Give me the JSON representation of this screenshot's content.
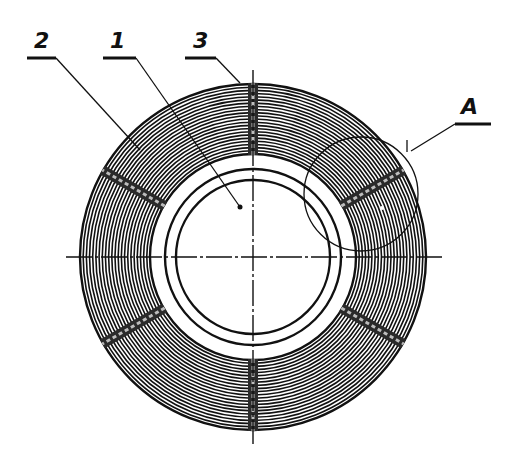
{
  "figure": {
    "type": "technical-drawing",
    "callouts": [
      {
        "id": "2",
        "label": "2",
        "x": 28,
        "y": 34,
        "target": [
          140,
          150
        ]
      },
      {
        "id": "1",
        "label": "1",
        "x": 104,
        "y": 34,
        "target": [
          240,
          207
        ]
      },
      {
        "id": "3",
        "label": "3",
        "x": 187,
        "y": 34,
        "target": [
          240,
          83
        ]
      },
      {
        "id": "A",
        "label": "A",
        "x": 455,
        "y": 92,
        "target": [
          410,
          150
        ]
      }
    ],
    "geometry": {
      "center": [
        253,
        257
      ],
      "outer_radius": 173,
      "coil_inner_radius": 103,
      "ring_outer_radius": 88,
      "ring_inner_radius": 77,
      "winding_turns": 22,
      "spacer_angles_deg": [
        30,
        90,
        150,
        210,
        270,
        330
      ],
      "detail_circle": {
        "label": "A",
        "center": [
          361,
          194
        ],
        "radius": 57
      }
    },
    "colors": {
      "ink": "#111111",
      "paper": "#ffffff",
      "spacer_fill": "#2a2a2a"
    }
  }
}
